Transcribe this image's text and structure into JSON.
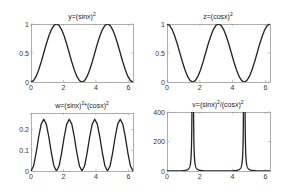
{
  "figure": {
    "background": "#ffffff",
    "line_color": "#222222",
    "axis_color": "#999999"
  },
  "chart_data": [
    {
      "type": "line",
      "id": "p1",
      "title": "y=(sinx)^2",
      "title_parts": {
        "base": "y=(sinx)",
        "sup": "2",
        "rest": ""
      },
      "xlabel": "",
      "ylabel": "",
      "xlim": [
        0,
        6.2832
      ],
      "ylim": [
        0,
        1
      ],
      "xticks": [
        0,
        2,
        4,
        6
      ],
      "xtick_labels": [
        "0",
        "2",
        "4",
        "6"
      ],
      "yticks": [
        0,
        0.5,
        1
      ],
      "ytick_labels": [
        "0",
        "0.5",
        "1"
      ],
      "grid": false,
      "box": {
        "left": 31,
        "top": 24,
        "right": 133,
        "bottom": 82
      },
      "x_step": 0.15708,
      "values": [
        0,
        0.0245,
        0.0955,
        0.2061,
        0.3455,
        0.5,
        0.6545,
        0.7939,
        0.9045,
        0.9755,
        1,
        0.9755,
        0.9045,
        0.7939,
        0.6545,
        0.5,
        0.3455,
        0.2061,
        0.0955,
        0.0245,
        0,
        0.0245,
        0.0955,
        0.2061,
        0.3455,
        0.5,
        0.6545,
        0.7939,
        0.9045,
        0.9755,
        1,
        0.9755,
        0.9045,
        0.7939,
        0.6545,
        0.5,
        0.3455,
        0.2061,
        0.0955,
        0.0245,
        0
      ]
    },
    {
      "type": "line",
      "id": "p2",
      "title": "z=(cosx)^2",
      "title_parts": {
        "base": "z=(cosx)",
        "sup": "2",
        "rest": ""
      },
      "xlabel": "",
      "ylabel": "",
      "xlim": [
        0,
        6.2832
      ],
      "ylim": [
        0,
        1
      ],
      "xticks": [
        0,
        2,
        4,
        6
      ],
      "xtick_labels": [
        "0",
        "2",
        "4",
        "6"
      ],
      "yticks": [
        0,
        0.5,
        1
      ],
      "ytick_labels": [
        "0",
        "0.5",
        "1"
      ],
      "grid": false,
      "box": {
        "left": 167,
        "top": 24,
        "right": 270,
        "bottom": 82
      },
      "x_step": 0.15708,
      "values": [
        1,
        0.9755,
        0.9045,
        0.7939,
        0.6545,
        0.5,
        0.3455,
        0.2061,
        0.0955,
        0.0245,
        0,
        0.0245,
        0.0955,
        0.2061,
        0.3455,
        0.5,
        0.6545,
        0.7939,
        0.9045,
        0.9755,
        1,
        0.9755,
        0.9045,
        0.7939,
        0.6545,
        0.5,
        0.3455,
        0.2061,
        0.0955,
        0.0245,
        0,
        0.0245,
        0.0955,
        0.2061,
        0.3455,
        0.5,
        0.6545,
        0.7939,
        0.9045,
        0.9755,
        1
      ]
    },
    {
      "type": "line",
      "id": "p3",
      "title": "w=(sinx)^2*(cosx)^2",
      "title_parts": {
        "base": "w=(sinx)",
        "sup": "2",
        "rest": "*(cosx)",
        "sup2": "2"
      },
      "xlabel": "",
      "ylabel": "",
      "xlim": [
        0,
        6.2832
      ],
      "ylim": [
        0,
        0.28
      ],
      "xticks": [
        0,
        2,
        4,
        6
      ],
      "xtick_labels": [
        "0",
        "2",
        "4",
        "6"
      ],
      "yticks": [
        0,
        0.1,
        0.2
      ],
      "ytick_labels": [
        "0",
        "0.1",
        "0.2"
      ],
      "grid": false,
      "box": {
        "left": 31,
        "top": 113,
        "right": 133,
        "bottom": 171
      },
      "x_step": 0.15708,
      "values": [
        0,
        0.0239,
        0.0864,
        0.1636,
        0.2261,
        0.25,
        0.2261,
        0.1636,
        0.0864,
        0.0239,
        0,
        0.0239,
        0.0864,
        0.1636,
        0.2261,
        0.25,
        0.2261,
        0.1636,
        0.0864,
        0.0239,
        0,
        0.0239,
        0.0864,
        0.1636,
        0.2261,
        0.25,
        0.2261,
        0.1636,
        0.0864,
        0.0239,
        0,
        0.0239,
        0.0864,
        0.1636,
        0.2261,
        0.25,
        0.2261,
        0.1636,
        0.0864,
        0.0239,
        0
      ]
    },
    {
      "type": "line",
      "id": "p4",
      "title": "v=(sinx)^2/(cosx)^2",
      "title_parts": {
        "base": "v=(sinx)",
        "sup": "2",
        "rest": "/(cosx)",
        "sup2": "2"
      },
      "xlabel": "",
      "ylabel": "",
      "xlim": [
        0,
        6.2832
      ],
      "ylim": [
        0,
        400
      ],
      "xticks": [
        0,
        2,
        4,
        6
      ],
      "xtick_labels": [
        "0",
        "2",
        "4",
        "6"
      ],
      "yticks": [
        0,
        200,
        400
      ],
      "ytick_labels": [
        "0",
        "200",
        "400"
      ],
      "grid": false,
      "box": {
        "left": 167,
        "top": 112,
        "right": 270,
        "bottom": 171
      },
      "x_step": 0.02618,
      "note": "tan^2(x); spikes at pi/2 and 3pi/2 exceed 400 and are clipped",
      "function": "tan2"
    }
  ]
}
